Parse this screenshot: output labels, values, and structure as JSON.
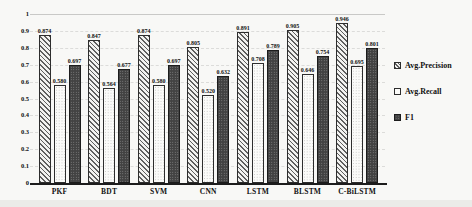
{
  "chart_data": {
    "type": "bar",
    "title": "",
    "xlabel": "",
    "ylabel": "",
    "categories": [
      "PKF",
      "BDT",
      "SVM",
      "CNN",
      "LSTM",
      "BLSTM",
      "C-BiLSTM"
    ],
    "series": [
      {
        "name": "Avg.Precision",
        "pattern": "precision",
        "pattern_desc": "gray-diagonal-stripes",
        "color": "#5f5f5f",
        "values": [
          0.874,
          0.847,
          0.874,
          0.805,
          0.891,
          0.905,
          0.946
        ]
      },
      {
        "name": "Avg.Recall",
        "pattern": "recall",
        "pattern_desc": "white-fine-dots",
        "color": "#fbfbf9",
        "values": [
          0.58,
          0.564,
          0.58,
          0.52,
          0.708,
          0.646,
          0.695
        ]
      },
      {
        "name": "F1",
        "pattern": "f1",
        "pattern_desc": "dark-dotted-weave",
        "color": "#424242",
        "values": [
          0.697,
          0.677,
          0.697,
          0.632,
          0.789,
          0.754,
          0.801
        ]
      }
    ],
    "ylim": [
      0,
      1
    ],
    "yticks": [
      "0",
      "0.1",
      "0.2",
      "0.3",
      "0.4",
      "0.5",
      "0.6",
      "0.7",
      "0.8",
      "0.9",
      "1"
    ],
    "grid": true,
    "legend_position": "right",
    "value_label_decimals": 3
  }
}
